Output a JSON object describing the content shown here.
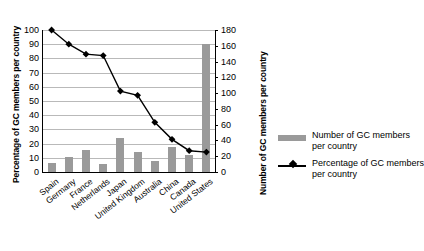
{
  "chart_data": {
    "type": "bar",
    "title": "",
    "categories": [
      "Spain",
      "Germany",
      "France",
      "Netherlands",
      "Japan",
      "United Kingdom",
      "Australia",
      "China",
      "Canada",
      "United States"
    ],
    "xlabel": "",
    "grid": true,
    "legend_position": "right",
    "series": [
      {
        "name": "Number of GC members per country",
        "type": "bar",
        "axis": "right",
        "color": "#9a9a9a",
        "values": [
          11,
          19,
          28,
          10,
          43,
          25,
          14,
          32,
          22,
          162
        ]
      },
      {
        "name": "Percentage of GC members per country",
        "type": "line",
        "axis": "left",
        "color": "#000000",
        "marker": "diamond",
        "values": [
          100,
          90,
          83,
          82,
          57,
          54,
          35,
          23,
          15,
          14
        ]
      }
    ],
    "left_axis": {
      "label": "Percentage of GC members per country",
      "ylim": [
        0,
        100
      ],
      "ticks": [
        0,
        10,
        20,
        30,
        40,
        50,
        60,
        70,
        80,
        90,
        100
      ]
    },
    "right_axis": {
      "label": "Number of GC members per country",
      "ylim": [
        0,
        180
      ],
      "ticks": [
        0,
        20,
        40,
        60,
        80,
        100,
        120,
        140,
        160,
        180
      ]
    }
  },
  "legend": {
    "items": [
      {
        "label_line1": "Number of GC members",
        "label_line2": "per country",
        "marker": "bar-swatch"
      },
      {
        "label_line1": "Percentage of GC members",
        "label_line2": "per country",
        "marker": "line-diamond"
      }
    ]
  }
}
